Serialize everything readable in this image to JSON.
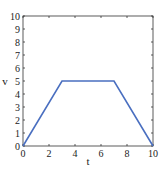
{
  "chart_data": {
    "type": "line",
    "title": "",
    "xlabel": "t",
    "ylabel": "v",
    "xlim": [
      0,
      10
    ],
    "ylim": [
      0,
      10
    ],
    "x_ticks": [
      0,
      2,
      4,
      6,
      8,
      10
    ],
    "y_ticks": [
      0,
      1,
      2,
      3,
      4,
      5,
      6,
      7,
      8,
      9,
      10
    ],
    "grid": false,
    "legend": null,
    "series": [
      {
        "name": "v(t)",
        "color": "#4a6fc0",
        "x": [
          0,
          3,
          7,
          10
        ],
        "y": [
          0,
          5,
          5,
          0
        ]
      }
    ]
  }
}
